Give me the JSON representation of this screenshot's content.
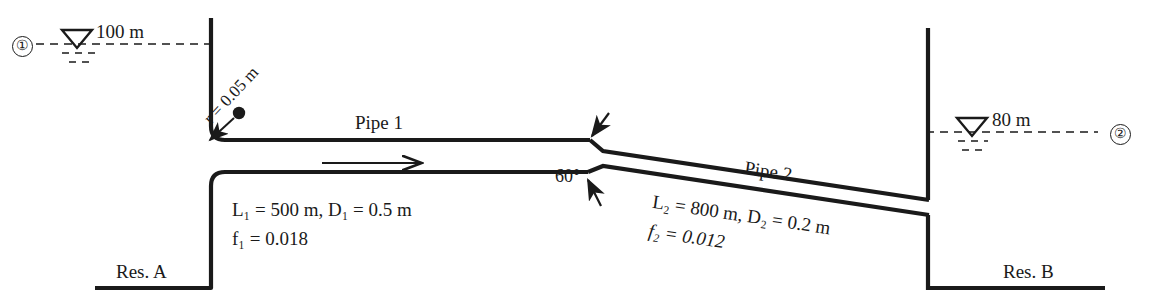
{
  "figure": {
    "ink_color": "#1a1a1a",
    "background_color": "#ffffff"
  },
  "reservoir_a": {
    "label": "Res. A",
    "node_marker": "①",
    "water_surface_elevation": "100 m",
    "surface_symbol": "water-surface-triangle"
  },
  "reservoir_b": {
    "label": "Res. B",
    "node_marker": "②",
    "water_surface_elevation": "80 m",
    "surface_symbol": "water-surface-triangle"
  },
  "entrance": {
    "radius_label": "r = 0.05 m",
    "type": "rounded-entrance"
  },
  "pipe1": {
    "name": "Pipe 1",
    "length_diameter": "L₁ = 500 m, D₁ = 0.5 m",
    "length_label_plain": "L",
    "length_sub": "1",
    "length_value": " = 500 m, D",
    "diameter_sub": "2",
    "friction_label": "f₁ = 0.018",
    "friction_f": "f",
    "friction_sub": "1",
    "friction_value": " = 0.018",
    "flow_direction": "left-to-right"
  },
  "pipe2": {
    "name": "Pipe 2",
    "length_diameter": "L₂ = 800 m, D₂ = 0.2 m",
    "friction_label": "f₂ = 0.012"
  },
  "junction": {
    "angle_label": "60°",
    "type": "sudden-contraction",
    "annotation": "contraction-arrows"
  }
}
